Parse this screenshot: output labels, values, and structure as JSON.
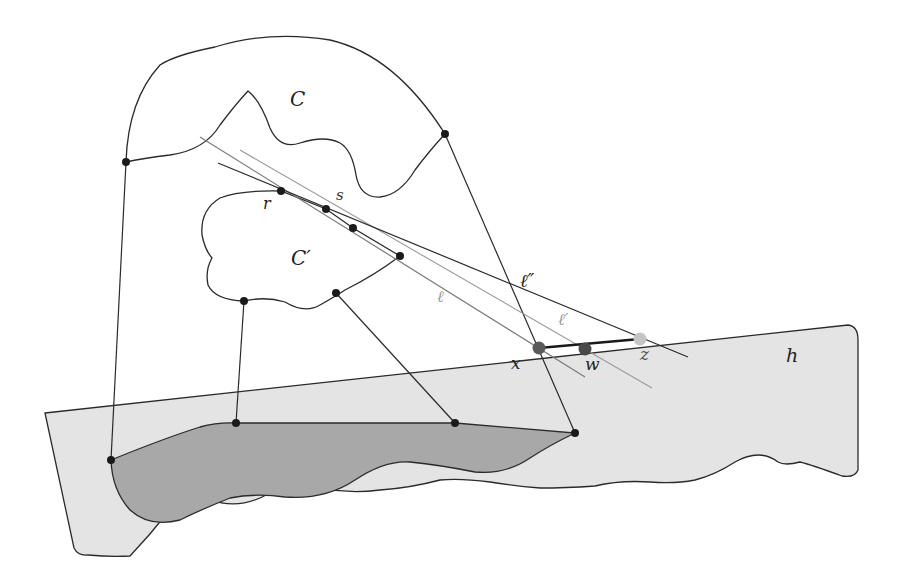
{
  "diagram": {
    "colors": {
      "stroke": "#2a2a2a",
      "plane_fill": "#e4e4e4",
      "shadow_fill": "#a8a8a8",
      "point": "#1a1a1a",
      "point_x": "#5a5a5a",
      "point_w": "#4a4a4a",
      "point_z": "#c4c4c4",
      "line_light": "#8a8a8a"
    },
    "labels": {
      "C": "C",
      "C_prime": "C′",
      "r": "r",
      "s": "s",
      "ell": "ℓ",
      "ell_prime": "ℓ′",
      "ell_double_prime": "ℓ″",
      "x": "x",
      "w": "w",
      "z": "z",
      "h": "h"
    },
    "points": [
      {
        "name": "C-left",
        "x": 126,
        "y": 162
      },
      {
        "name": "C-right",
        "x": 445,
        "y": 134
      },
      {
        "name": "r",
        "x": 281,
        "y": 191
      },
      {
        "name": "s",
        "x": 326,
        "y": 209
      },
      {
        "name": "Cp-tangent-2",
        "x": 353,
        "y": 228
      },
      {
        "name": "Cp-right",
        "x": 400,
        "y": 256
      },
      {
        "name": "Cp-bottom-left",
        "x": 244,
        "y": 301
      },
      {
        "name": "Cp-bottom-mid",
        "x": 336,
        "y": 293
      },
      {
        "name": "shadow-left",
        "x": 111,
        "y": 460
      },
      {
        "name": "shadow-top-1",
        "x": 236,
        "y": 423
      },
      {
        "name": "shadow-top-2",
        "x": 455,
        "y": 423
      },
      {
        "name": "shadow-right",
        "x": 575,
        "y": 433
      },
      {
        "name": "x",
        "x": 539,
        "y": 348
      },
      {
        "name": "w",
        "x": 585,
        "y": 349
      },
      {
        "name": "z",
        "x": 640,
        "y": 339
      }
    ]
  }
}
